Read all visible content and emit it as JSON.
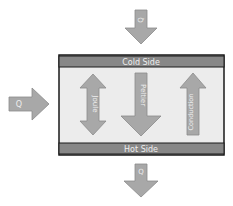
{
  "colors": {
    "arrow_fill": "#a8a8a8",
    "arrow_stroke": "#8a8a8a",
    "side_bar": "#878787",
    "box_fill": "#ececec",
    "box_border": "#1a1a1a",
    "label": "#f0f0f0"
  },
  "cold_side": {
    "label": "Cold Side"
  },
  "hot_side": {
    "label": "Hot Side"
  },
  "external_arrows": {
    "top": {
      "label": "Q",
      "direction": "down"
    },
    "left": {
      "label": "Q",
      "direction": "right"
    },
    "bottom": {
      "label": "Q",
      "direction": "down"
    }
  },
  "internal_arrows": [
    {
      "label": "Joule",
      "direction": "both"
    },
    {
      "label": "Peltier",
      "direction": "down"
    },
    {
      "label": "Conduction",
      "direction": "up"
    }
  ]
}
